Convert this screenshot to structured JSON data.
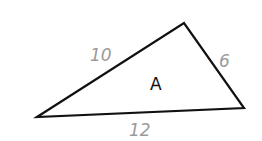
{
  "diagram": {
    "shape": "triangle",
    "vertices": [
      [
        37,
        117
      ],
      [
        184,
        23
      ],
      [
        244,
        108
      ]
    ],
    "stroke_color": "#111111",
    "label_color": "#9a9a9a",
    "region_label": "A",
    "sides": [
      {
        "name": "left",
        "label": "10"
      },
      {
        "name": "right",
        "label": "6"
      },
      {
        "name": "bottom",
        "label": "12"
      }
    ]
  }
}
